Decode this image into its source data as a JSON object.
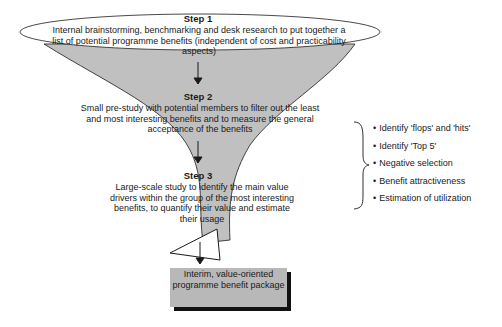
{
  "diagram": {
    "type": "funnel-process",
    "colors": {
      "funnel_fill": "#c0c0c0",
      "ellipse_fill": "#ffffff",
      "result_box_fill": "#b8b8b8",
      "result_box_shadow": "#111111",
      "line": "#1a1a1a"
    },
    "steps": [
      {
        "title": "Step 1",
        "text": "Internal brainstorming, benchmarking and desk research to put together a list of potential programme benefits (independent of cost and practicability aspects)"
      },
      {
        "title": "Step 2",
        "text": "Small pre-study with potential members to filter out the least and most interesting benefits and to measure the general acceptance of the benefits"
      },
      {
        "title": "Step 3",
        "text": "Large-scale study to identify the main value drivers within the group of the most interesting benefits, to quantify their value and estimate their usage"
      }
    ],
    "result": {
      "text": "Interim, value-oriented programme benefit package"
    },
    "methods": [
      {
        "label": "Identify 'flops' and 'hits'"
      },
      {
        "label": "Identify 'Top 5'"
      },
      {
        "label": "Negative selection"
      },
      {
        "label": "Benefit attractiveness"
      },
      {
        "label": "Estimation of utilization"
      }
    ]
  }
}
